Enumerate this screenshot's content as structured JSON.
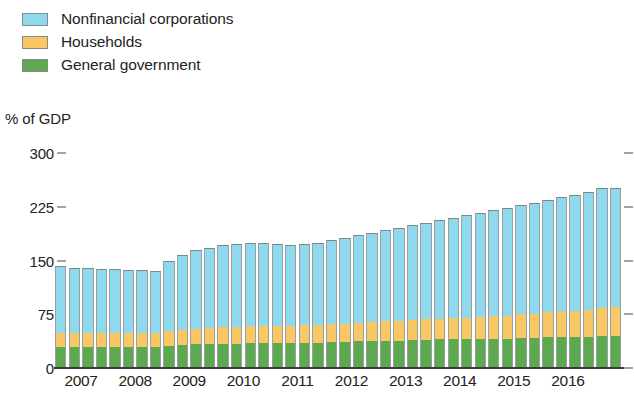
{
  "legend": {
    "position": "top-left",
    "items": [
      {
        "label": "Nonfinancial corporations",
        "color": "#8ed9ee",
        "key": "nfc"
      },
      {
        "label": "Households",
        "color": "#f9c763",
        "key": "hh"
      },
      {
        "label": "General government",
        "color": "#5da94f",
        "key": "gov"
      }
    ]
  },
  "axis": {
    "ylabel": "% of GDP",
    "yticks": [
      "300",
      "225",
      "150",
      "75",
      "0"
    ],
    "xticks": [
      "2007",
      "2008",
      "2009",
      "2010",
      "2011",
      "2012",
      "2013",
      "2014",
      "2015",
      "2016"
    ]
  },
  "chart_data": {
    "type": "bar",
    "stacked": true,
    "title": "",
    "subtitle": "",
    "xlabel": "",
    "ylabel": "% of GDP",
    "ylim": [
      0,
      300
    ],
    "yticks": [
      0,
      75,
      150,
      225,
      300
    ],
    "grid": false,
    "legend_position": "top-left",
    "note": "Quarterly observations, 2007Q1 through 2017Q2. Year tick labels mark the first quarter of each year.",
    "categories": [
      "2007Q1",
      "2007Q2",
      "2007Q3",
      "2007Q4",
      "2008Q1",
      "2008Q2",
      "2008Q3",
      "2008Q4",
      "2009Q1",
      "2009Q2",
      "2009Q3",
      "2009Q4",
      "2010Q1",
      "2010Q2",
      "2010Q3",
      "2010Q4",
      "2011Q1",
      "2011Q2",
      "2011Q3",
      "2011Q4",
      "2012Q1",
      "2012Q2",
      "2012Q3",
      "2012Q4",
      "2013Q1",
      "2013Q2",
      "2013Q3",
      "2013Q4",
      "2014Q1",
      "2014Q2",
      "2014Q3",
      "2014Q4",
      "2015Q1",
      "2015Q2",
      "2015Q3",
      "2015Q4",
      "2016Q1",
      "2016Q2",
      "2016Q3",
      "2016Q4",
      "2017Q1",
      "2017Q2"
    ],
    "series": [
      {
        "name": "General government",
        "color": "#5da94f",
        "values": [
          29,
          29,
          29,
          29,
          29,
          29,
          29,
          29,
          31,
          32,
          33,
          34,
          34,
          34,
          35,
          35,
          35,
          35,
          35,
          35,
          36,
          36,
          37,
          37,
          38,
          38,
          39,
          39,
          40,
          40,
          40,
          40,
          41,
          41,
          42,
          42,
          43,
          43,
          43,
          43,
          44,
          44
        ]
      },
      {
        "name": "Households",
        "color": "#f9c763",
        "values": [
          20,
          20,
          20,
          20,
          20,
          20,
          20,
          20,
          21,
          21,
          22,
          22,
          23,
          23,
          23,
          24,
          24,
          24,
          25,
          25,
          25,
          26,
          26,
          27,
          27,
          28,
          28,
          29,
          29,
          30,
          30,
          31,
          31,
          32,
          33,
          34,
          35,
          36,
          37,
          38,
          40,
          41
        ]
      },
      {
        "name": "Nonfinancial corporations",
        "color": "#8ed9ee",
        "values": [
          93,
          91,
          90,
          89,
          89,
          88,
          88,
          87,
          98,
          105,
          110,
          112,
          115,
          116,
          116,
          115,
          114,
          113,
          113,
          114,
          117,
          120,
          122,
          124,
          127,
          129,
          132,
          135,
          138,
          140,
          143,
          145,
          148,
          150,
          152,
          154,
          156,
          159,
          162,
          165,
          167,
          166
        ]
      }
    ],
    "totals": [
      142,
      140,
      139,
      138,
      138,
      137,
      137,
      136,
      150,
      158,
      165,
      168,
      172,
      173,
      174,
      174,
      173,
      172,
      173,
      174,
      178,
      182,
      185,
      188,
      192,
      195,
      199,
      203,
      207,
      210,
      213,
      216,
      220,
      223,
      227,
      230,
      234,
      238,
      242,
      246,
      251,
      251
    ]
  }
}
